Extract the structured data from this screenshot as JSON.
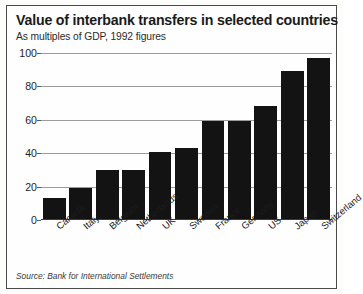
{
  "chart_data": {
    "type": "bar",
    "title": "Value of interbank transfers in selected countries",
    "subtitle": "As multiples of GDP, 1992 figures",
    "source": "Source: Bank for International Settlements",
    "xlabel": "",
    "ylabel": "",
    "ylim": [
      0,
      100
    ],
    "yticks": [
      0,
      20,
      40,
      60,
      80,
      100
    ],
    "ytick_labels": [
      "0",
      "20",
      "40",
      "60",
      "80",
      "100"
    ],
    "grid": true,
    "legend": "none",
    "bar_color": "#131313",
    "categories": [
      "Canada",
      "Italy",
      "Belgium",
      "Netherlands",
      "UK",
      "Sweden",
      "France",
      "Germany",
      "US",
      "Japan",
      "Switzerland"
    ],
    "values": [
      13,
      19,
      30,
      30,
      41,
      43,
      59,
      59,
      68,
      89,
      97
    ]
  }
}
